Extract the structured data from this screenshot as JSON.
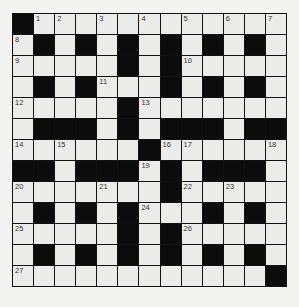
{
  "puzzle": {
    "type": "crossword",
    "rows": 13,
    "cols": 13,
    "colors": {
      "black": "#0c0c0c",
      "white": "#ebebea",
      "border": "#111111",
      "background": "#f3f3f1"
    },
    "grid": [
      "#............",
      ".#.#.#.#.#.#.",
      ".....#.#.....",
      ".#.#...#.#.#.",
      ".....#.......",
      ".###.#.###.##",
      "......#......",
      "##.###.#.###.",
      ".......#.....",
      ".#.#.#...#.#.",
      ".....#.#.....",
      ".#.#.#.#.#.#.",
      "............#"
    ],
    "numbers": [
      {
        "r": 0,
        "c": 1,
        "n": "1"
      },
      {
        "r": 0,
        "c": 2,
        "n": "2"
      },
      {
        "r": 0,
        "c": 4,
        "n": "3"
      },
      {
        "r": 0,
        "c": 6,
        "n": "4"
      },
      {
        "r": 0,
        "c": 8,
        "n": "5"
      },
      {
        "r": 0,
        "c": 10,
        "n": "6"
      },
      {
        "r": 0,
        "c": 12,
        "n": "7"
      },
      {
        "r": 1,
        "c": 0,
        "n": "8"
      },
      {
        "r": 2,
        "c": 0,
        "n": "9"
      },
      {
        "r": 2,
        "c": 8,
        "n": "10"
      },
      {
        "r": 3,
        "c": 4,
        "n": "11"
      },
      {
        "r": 4,
        "c": 0,
        "n": "12"
      },
      {
        "r": 4,
        "c": 6,
        "n": "13"
      },
      {
        "r": 6,
        "c": 0,
        "n": "14"
      },
      {
        "r": 6,
        "c": 2,
        "n": "15"
      },
      {
        "r": 6,
        "c": 7,
        "n": "16"
      },
      {
        "r": 6,
        "c": 8,
        "n": "17"
      },
      {
        "r": 6,
        "c": 12,
        "n": "18"
      },
      {
        "r": 7,
        "c": 6,
        "n": "19"
      },
      {
        "r": 8,
        "c": 0,
        "n": "20"
      },
      {
        "r": 8,
        "c": 4,
        "n": "21"
      },
      {
        "r": 8,
        "c": 8,
        "n": "22"
      },
      {
        "r": 8,
        "c": 10,
        "n": "23"
      },
      {
        "r": 9,
        "c": 6,
        "n": "24"
      },
      {
        "r": 10,
        "c": 0,
        "n": "25"
      },
      {
        "r": 10,
        "c": 8,
        "n": "26"
      },
      {
        "r": 12,
        "c": 0,
        "n": "27"
      }
    ]
  }
}
